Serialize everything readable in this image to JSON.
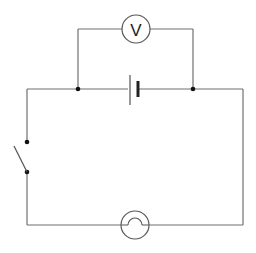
{
  "diagram": {
    "components": {
      "voltmeter": {
        "symbol": "V",
        "label": "V"
      },
      "cell": {
        "type": "cell"
      },
      "switch": {
        "type": "switch",
        "state": "open"
      },
      "lamp": {
        "type": "lamp / filament bulb"
      }
    },
    "junctions": 2,
    "colors": {
      "wire": "#707070",
      "component": "#555555",
      "dot": "#111111",
      "background": "#ffffff"
    }
  }
}
